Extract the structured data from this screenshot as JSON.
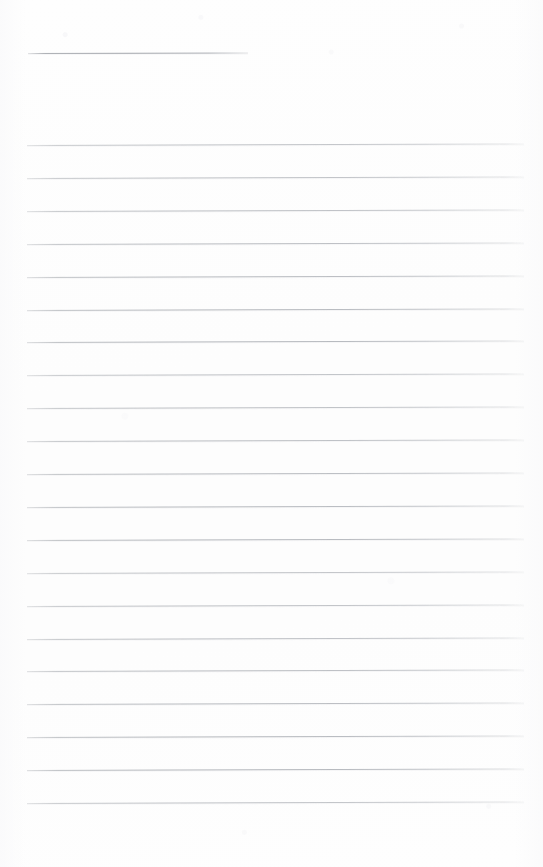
{
  "document": {
    "kind": "scanned-blank-ruled-notepad-page",
    "page_width": 543,
    "page_height": 867,
    "background_color": "#fdfdfd",
    "has_text_content": false,
    "text_content": "",
    "orientation": "portrait"
  },
  "title_rule": {
    "label": "title-rule",
    "x_start": 28,
    "x_end": 248,
    "y": 53,
    "thickness": 1,
    "color": "#a5a8ae"
  },
  "body_rules": {
    "label": "ruled-lines",
    "count": 21,
    "x_start": 27,
    "x_end": 524,
    "first_y": 145,
    "spacing": 32.9,
    "thickness": 1,
    "color": "#b4b7bc",
    "tilt_degrees": -0.18,
    "y_positions": [
      145,
      178,
      211,
      244,
      277,
      310,
      342,
      375,
      408,
      441,
      474,
      507,
      540,
      573,
      606,
      639,
      671,
      704,
      737,
      770,
      803
    ]
  },
  "margins": {
    "top_blank_height": 53,
    "bottom_blank_height": 64,
    "left": 27,
    "right": 19
  }
}
